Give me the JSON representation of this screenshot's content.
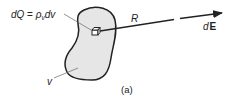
{
  "diagram": {
    "charge_label": {
      "prefix": "dQ",
      "equals": " = ",
      "rho": "ρ",
      "subscript": "v",
      "suffix": "dv"
    },
    "distance_label": "R",
    "field_label": {
      "d": "d",
      "E": "E"
    },
    "volume_label": "v",
    "caption": "(a)",
    "colors": {
      "region_fill": "#e6e6e6",
      "stroke": "#222222",
      "leader": "#666666"
    }
  }
}
